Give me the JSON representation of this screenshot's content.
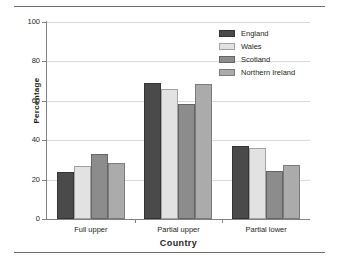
{
  "chart_data": {
    "type": "bar",
    "title": "",
    "subtitle": "",
    "xlabel": "Country",
    "ylabel": "Percentage",
    "categories": [
      "Full upper",
      "Partial upper",
      "Partial lower"
    ],
    "series": [
      {
        "name": "England",
        "color": "#4a4a4a",
        "values": [
          24,
          69,
          37
        ]
      },
      {
        "name": "Wales",
        "color": "#e2e2e2",
        "values": [
          27,
          66,
          36
        ]
      },
      {
        "name": "Scotland",
        "color": "#8c8c8c",
        "values": [
          33,
          58.5,
          24.5
        ]
      },
      {
        "name": "Northern Ireland",
        "color": "#ababab",
        "values": [
          28.5,
          68.5,
          27.5
        ]
      }
    ],
    "ylim": [
      0,
      100
    ],
    "yticks": [
      0,
      20,
      40,
      60,
      80,
      100
    ],
    "ytick_labels": [
      "0",
      "20",
      "40",
      "60",
      "80",
      "100"
    ],
    "grid": true,
    "legend_position": "top-right"
  },
  "legend": {
    "entries": [
      {
        "label": "England"
      },
      {
        "label": "Wales"
      },
      {
        "label": "Scotland"
      },
      {
        "label": "Northern Ireland"
      }
    ]
  },
  "axes": {
    "y_title": "Percentage",
    "x_title": "Country"
  }
}
